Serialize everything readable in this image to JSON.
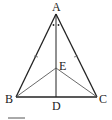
{
  "diagram": {
    "type": "geometry",
    "stroke_color": "#222222",
    "points": {
      "A": {
        "label": "A",
        "x": 56,
        "y": 14
      },
      "B": {
        "label": "B",
        "x": 16,
        "y": 97
      },
      "C": {
        "label": "C",
        "x": 97,
        "y": 97
      },
      "D": {
        "label": "D",
        "x": 56,
        "y": 97
      },
      "E": {
        "label": "E",
        "x": 56,
        "y": 68
      }
    },
    "segments": [
      "AB",
      "AC",
      "BC",
      "AD",
      "BE",
      "CE"
    ],
    "marks": {
      "equal_sides": [
        "AB",
        "AC"
      ],
      "equal_angles_at_A": [
        "BAD",
        "CAD"
      ]
    }
  }
}
